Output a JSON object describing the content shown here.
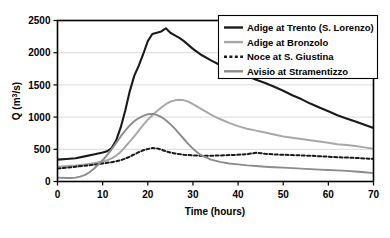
{
  "chart_data": {
    "type": "line",
    "title": "",
    "xlabel": "Time (hours)",
    "ylabel": "Q (m3/s)",
    "ylabel_base": "Q (m",
    "ylabel_sup": "3",
    "ylabel_tail": "/s)",
    "xlim": [
      0,
      70
    ],
    "ylim": [
      0,
      2500
    ],
    "xticks": [
      0,
      10,
      20,
      30,
      40,
      50,
      60,
      70
    ],
    "yticks": [
      0,
      500,
      1000,
      1500,
      2000,
      2500
    ],
    "xtick_labels": [
      "0",
      "10",
      "20",
      "30",
      "40",
      "50",
      "60",
      "70"
    ],
    "ytick_labels": [
      "0",
      "500",
      "1000",
      "1500",
      "2000",
      "2500"
    ],
    "grid": "horizontal",
    "legend_position": "top-right",
    "series": [
      {
        "name": "Adige at Trento (S. Lorenzo)",
        "color": "#1a1a1a",
        "width": 2.1,
        "dash": "none",
        "x": [
          0,
          2,
          4,
          6,
          8,
          10,
          11,
          12,
          13,
          14,
          15,
          16,
          17,
          18,
          19,
          20,
          21,
          22,
          23,
          24,
          25,
          26,
          27,
          28,
          30,
          32,
          34,
          36,
          38,
          40,
          42,
          44,
          46,
          48,
          50,
          52,
          54,
          56,
          58,
          60,
          62,
          64,
          66,
          68,
          70
        ],
        "y": [
          340,
          350,
          360,
          390,
          420,
          450,
          470,
          520,
          640,
          840,
          1100,
          1400,
          1640,
          1800,
          1980,
          2180,
          2290,
          2310,
          2330,
          2380,
          2310,
          2270,
          2230,
          2180,
          2060,
          1960,
          1880,
          1810,
          1740,
          1690,
          1640,
          1580,
          1530,
          1470,
          1410,
          1340,
          1280,
          1210,
          1150,
          1090,
          1030,
          980,
          930,
          880,
          830
        ]
      },
      {
        "name": "Adige at Bronzolo",
        "color": "#a8a8a8",
        "width": 2.0,
        "dash": "none",
        "x": [
          0,
          2,
          4,
          6,
          8,
          10,
          11,
          12,
          13,
          14,
          15,
          16,
          17,
          18,
          19,
          20,
          21,
          22,
          23,
          24,
          25,
          26,
          27,
          28,
          29,
          30,
          32,
          34,
          36,
          38,
          40,
          42,
          44,
          46,
          48,
          50,
          52,
          54,
          56,
          58,
          60,
          62,
          64,
          66,
          68,
          70
        ],
        "y": [
          230,
          240,
          250,
          265,
          285,
          310,
          330,
          360,
          400,
          460,
          540,
          620,
          700,
          790,
          880,
          960,
          1030,
          1090,
          1150,
          1200,
          1240,
          1260,
          1270,
          1260,
          1240,
          1200,
          1120,
          1040,
          970,
          910,
          860,
          820,
          790,
          760,
          730,
          700,
          680,
          660,
          640,
          620,
          600,
          580,
          565,
          550,
          530,
          510
        ]
      },
      {
        "name": "Noce at S. Giustina",
        "color": "#1a1a1a",
        "width": 2.0,
        "dash": "3,2.4",
        "x": [
          0,
          2,
          4,
          6,
          8,
          10,
          12,
          14,
          15,
          16,
          17,
          18,
          19,
          20,
          21,
          22,
          23,
          24,
          25,
          26,
          27,
          28,
          30,
          32,
          34,
          36,
          38,
          40,
          42,
          43,
          44,
          45,
          46,
          48,
          50,
          52,
          54,
          56,
          58,
          60,
          62,
          64,
          66,
          68,
          70
        ],
        "y": [
          200,
          215,
          230,
          245,
          260,
          280,
          300,
          330,
          355,
          385,
          420,
          455,
          485,
          505,
          520,
          515,
          495,
          470,
          450,
          435,
          425,
          415,
          405,
          400,
          400,
          405,
          410,
          415,
          425,
          435,
          445,
          440,
          430,
          420,
          415,
          410,
          405,
          400,
          392,
          385,
          378,
          372,
          366,
          358,
          350
        ]
      },
      {
        "name": "Avisio at Stramentizzo",
        "color": "#8c8c8c",
        "width": 1.9,
        "dash": "none",
        "x": [
          0,
          2,
          3,
          4,
          5,
          6,
          7,
          8,
          9,
          10,
          11,
          12,
          13,
          14,
          15,
          16,
          17,
          18,
          19,
          20,
          21,
          22,
          23,
          24,
          25,
          26,
          27,
          28,
          29,
          30,
          31,
          32,
          34,
          36,
          38,
          40,
          42,
          44,
          46,
          48,
          50,
          52,
          54,
          56,
          58,
          60,
          62,
          64,
          66,
          68,
          70
        ],
        "y": [
          60,
          55,
          55,
          60,
          75,
          100,
          140,
          195,
          260,
          330,
          410,
          500,
          600,
          700,
          790,
          870,
          935,
          985,
          1020,
          1045,
          1050,
          1035,
          1000,
          950,
          890,
          820,
          740,
          660,
          580,
          510,
          450,
          400,
          340,
          305,
          280,
          265,
          250,
          240,
          230,
          222,
          215,
          208,
          200,
          192,
          185,
          178,
          172,
          165,
          155,
          143,
          130
        ]
      }
    ]
  },
  "legend": {
    "items": [
      {
        "label": "Adige at Trento (S. Lorenzo)",
        "color": "#1a1a1a",
        "dash": "none",
        "width": 2.4
      },
      {
        "label": "Adige at Bronzolo",
        "color": "#a8a8a8",
        "dash": "none",
        "width": 2.4
      },
      {
        "label": "Noce at S. Giustina",
        "color": "#1a1a1a",
        "dash": "3,2.4",
        "width": 2.4
      },
      {
        "label": "Avisio at Stramentizzo",
        "color": "#8c8c8c",
        "dash": "none",
        "width": 2.4
      }
    ]
  },
  "colors": {
    "frame": "#000000",
    "grid": "#d9d9d9",
    "background": "#ffffff",
    "text": "#000000"
  }
}
